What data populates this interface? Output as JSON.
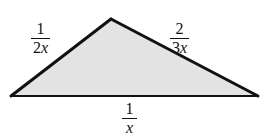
{
  "figure": {
    "type": "geometry-diagram",
    "shape": "triangle",
    "background_color": "#ffffff",
    "fill_color": "#e3e3e3",
    "stroke_color": "#111111",
    "base_stroke_width": 2,
    "side_stroke_width": 3,
    "vertices": {
      "left": {
        "x": 11,
        "y": 96
      },
      "apex": {
        "x": 111,
        "y": 19
      },
      "right": {
        "x": 258,
        "y": 96
      }
    },
    "labels": {
      "left_side": {
        "name": "left-side-length",
        "numerator": "1",
        "denominator_coefficient": "2",
        "denominator_variable": "x",
        "text": "1/2x"
      },
      "right_side": {
        "name": "right-side-length",
        "numerator": "2",
        "denominator_coefficient": "3",
        "denominator_variable": "x",
        "text": "2/3x"
      },
      "base": {
        "name": "base-length",
        "numerator": "1",
        "denominator_coefficient": "",
        "denominator_variable": "x",
        "text": "1/x"
      }
    }
  }
}
